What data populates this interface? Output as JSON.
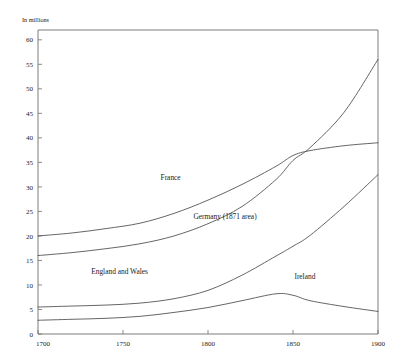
{
  "chart_data": {
    "type": "line",
    "title": "",
    "subtitle": "",
    "unit_label": "In millions",
    "xlabel": "",
    "ylabel": "",
    "xlim": [
      1700,
      1900
    ],
    "ylim": [
      0,
      62
    ],
    "grid": false,
    "legend": "inline-labels",
    "x_ticks": [
      "1700",
      "1750",
      "1800",
      "1850",
      "1900"
    ],
    "x_tick_values": [
      1700,
      1750,
      1800,
      1850,
      1900
    ],
    "y_ticks": [
      "0",
      "5",
      "10",
      "15",
      "20",
      "25",
      "30",
      "35",
      "40",
      "45",
      "50",
      "55",
      "60"
    ],
    "y_tick_values": [
      0,
      5,
      10,
      15,
      20,
      25,
      30,
      35,
      40,
      45,
      50,
      55,
      60
    ],
    "series": [
      {
        "name": "France",
        "label": "France",
        "x": [
          1700,
          1720,
          1740,
          1760,
          1780,
          1800,
          1820,
          1840,
          1850,
          1860,
          1880,
          1900
        ],
        "values": [
          20.0,
          20.6,
          21.5,
          22.6,
          24.6,
          27.3,
          30.5,
          34.2,
          36.4,
          37.4,
          38.4,
          39.0
        ]
      },
      {
        "name": "Germany (1871 area)",
        "label": "Germany (1871 area)",
        "x": [
          1700,
          1720,
          1740,
          1760,
          1780,
          1800,
          1820,
          1840,
          1850,
          1860,
          1880,
          1900
        ],
        "values": [
          16.0,
          16.6,
          17.4,
          18.4,
          20.0,
          22.5,
          26.0,
          31.5,
          35.4,
          38.0,
          45.2,
          56.0
        ]
      },
      {
        "name": "England and Wales",
        "label": "England and Wales",
        "x": [
          1700,
          1720,
          1740,
          1760,
          1780,
          1800,
          1820,
          1840,
          1850,
          1860,
          1880,
          1900
        ],
        "values": [
          5.5,
          5.7,
          5.9,
          6.3,
          7.2,
          8.9,
          12.0,
          15.9,
          17.9,
          20.1,
          26.0,
          32.5
        ]
      },
      {
        "name": "Ireland",
        "label": "Ireland",
        "x": [
          1700,
          1720,
          1740,
          1760,
          1780,
          1800,
          1820,
          1840,
          1850,
          1860,
          1880,
          1900
        ],
        "values": [
          2.8,
          3.0,
          3.2,
          3.6,
          4.4,
          5.4,
          6.8,
          8.2,
          7.9,
          6.8,
          5.6,
          4.6
        ]
      }
    ],
    "series_label_positions": [
      {
        "name": "France",
        "x": 1778,
        "y": 31.5
      },
      {
        "name": "Germany (1871 area)",
        "x": 1810,
        "y": 23.5
      },
      {
        "name": "England and Wales",
        "x": 1748,
        "y": 12.3
      },
      {
        "name": "Ireland",
        "x": 1857,
        "y": 11.2
      }
    ]
  }
}
